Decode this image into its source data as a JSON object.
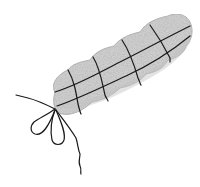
{
  "illustration": {
    "subject": "Tied roast with string netting",
    "style": "pencil sketch",
    "colors": {
      "background": "#ffffff",
      "body_fill": "#d4d4d4",
      "body_shade": "#b8b8b8",
      "string": "#1a1a1a"
    },
    "parts": {
      "body": "roast-body",
      "lengthwise_strings": 2,
      "cross_ties": 4,
      "knot": "bow",
      "bow_loops": 2,
      "trailing_strings": 2
    }
  }
}
